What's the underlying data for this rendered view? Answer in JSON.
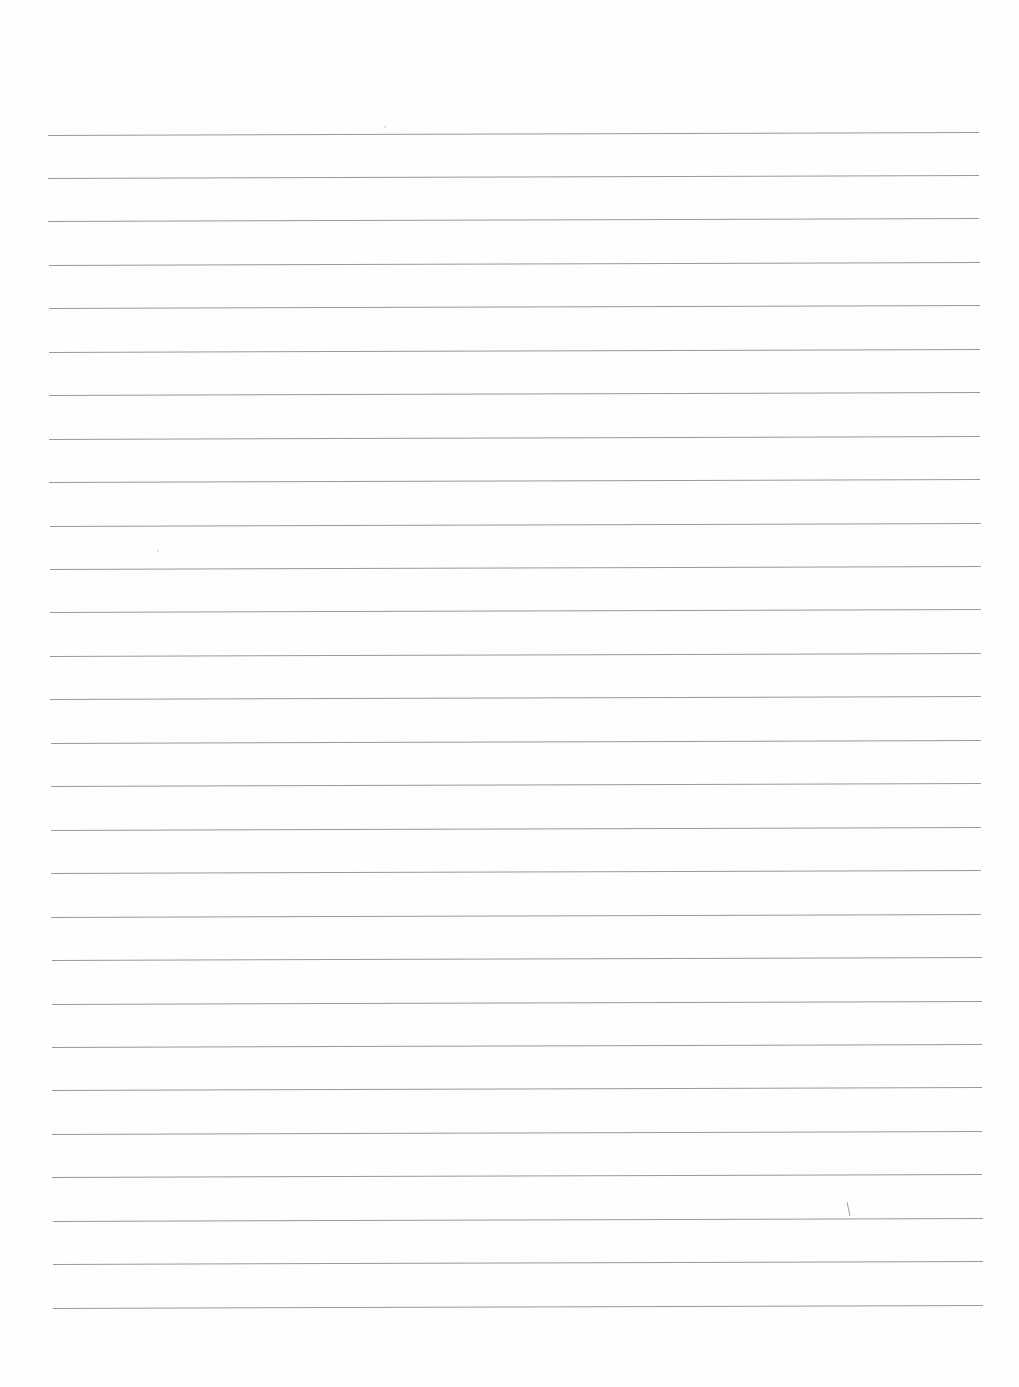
{
  "page": {
    "type": "lined-paper",
    "background": "#fefefe",
    "rule_color": "#8e8e8e",
    "rule_count": 28,
    "rules": {
      "first_y": 134.5,
      "spacing": 43.45,
      "left_top": 48,
      "left_bottom": 53,
      "right_top": 979,
      "right_bottom": 983,
      "tilt_deg": -0.18
    },
    "text": ""
  }
}
